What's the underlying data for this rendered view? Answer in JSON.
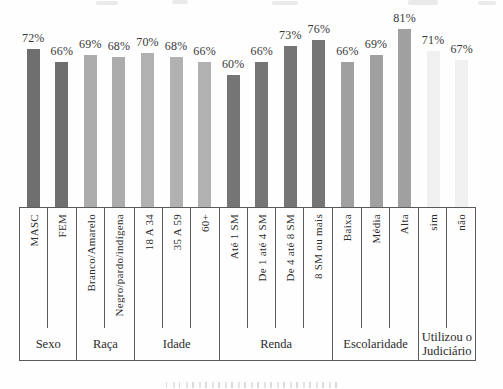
{
  "chart_data": {
    "type": "bar",
    "title": "",
    "xlabel": "",
    "ylabel": "",
    "unit": "%",
    "value_label_suffix": "%",
    "legend": "none",
    "grid": false,
    "y_axis_visible": false,
    "layout": {
      "px_per_percent": 2.2,
      "bar_width_px": 13
    },
    "groups": [
      {
        "label": "Sexo",
        "color": "#6f6f6f",
        "items": [
          {
            "label": "MASC",
            "value": 72
          },
          {
            "label": "FEM",
            "value": 66
          }
        ]
      },
      {
        "label": "Raça",
        "color": "#acacac",
        "items": [
          {
            "label": "Branco/Amarelo",
            "value": 69
          },
          {
            "label": "Negro/pardo/indígena",
            "value": 68
          }
        ]
      },
      {
        "label": "Idade",
        "color": "#b1b1b1",
        "items": [
          {
            "label": "18 A 34",
            "value": 70
          },
          {
            "label": "35 A 59",
            "value": 68
          },
          {
            "label": "60+",
            "value": 66
          }
        ]
      },
      {
        "label": "Renda",
        "color": "#757575",
        "items": [
          {
            "label": "Até 1 SM",
            "value": 60
          },
          {
            "label": "De 1 até 4 SM",
            "value": 66
          },
          {
            "label": "De 4 até 8 SM",
            "value": 73
          },
          {
            "label": "8 SM ou mais",
            "value": 76
          }
        ]
      },
      {
        "label": "Escolaridade",
        "color": "#a0a0a0",
        "items": [
          {
            "label": "Baixa",
            "value": 66
          },
          {
            "label": "Média",
            "value": 69
          },
          {
            "label": "Alta",
            "value": 81
          }
        ]
      },
      {
        "label": "Utilizou o Judiciário",
        "color": "#f0f0f0",
        "items": [
          {
            "label": "sim",
            "value": 71
          },
          {
            "label": "não",
            "value": 67
          }
        ]
      }
    ]
  }
}
